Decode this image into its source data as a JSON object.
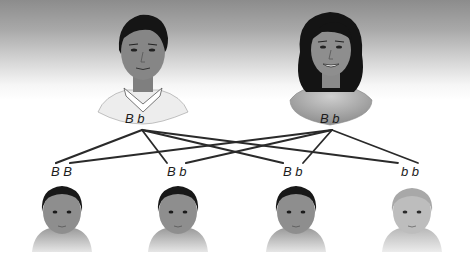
{
  "diagram": {
    "type": "inheritance-cross",
    "parents": [
      {
        "id": "father",
        "role": "father",
        "genotype": [
          "B",
          "b"
        ],
        "label": "B  b"
      },
      {
        "id": "mother",
        "role": "mother",
        "genotype": [
          "B",
          "b"
        ],
        "label": "B  b"
      }
    ],
    "offspring": [
      {
        "id": "child-1",
        "genotype": [
          "B",
          "B"
        ],
        "label": "B  B",
        "alleles": [
          {
            "allele": "B",
            "from": "father"
          },
          {
            "allele": "B",
            "from": "mother"
          }
        ]
      },
      {
        "id": "child-2",
        "genotype": [
          "B",
          "b"
        ],
        "label": "B  b",
        "alleles": [
          {
            "allele": "B",
            "from": "father"
          },
          {
            "allele": "b",
            "from": "mother"
          }
        ]
      },
      {
        "id": "child-3",
        "genotype": [
          "B",
          "b"
        ],
        "label": "B  b",
        "alleles": [
          {
            "allele": "B",
            "from": "father"
          },
          {
            "allele": "b",
            "from": "mother"
          }
        ]
      },
      {
        "id": "child-4",
        "genotype": [
          "b",
          "b"
        ],
        "label": "b  b",
        "alleles": [
          {
            "allele": "b",
            "from": "father"
          },
          {
            "allele": "b",
            "from": "mother"
          }
        ]
      }
    ],
    "colors": {
      "line": "#2a2a2a",
      "skin": "#8e8e8e",
      "hair": "#1a1a1a",
      "light_baby_skin": "#bdbdbd",
      "background_top": "#8c8c8c",
      "background_bottom": "#ffffff"
    }
  }
}
